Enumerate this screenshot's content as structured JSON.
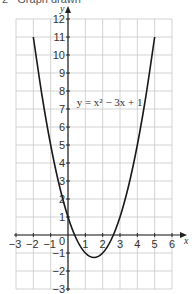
{
  "header": {
    "number": "2",
    "text": "Graph drawn"
  },
  "chart_data": {
    "type": "line",
    "title": "",
    "xlabel": "x",
    "ylabel": "y",
    "xlim": [
      -3,
      6
    ],
    "ylim": [
      -3,
      12
    ],
    "grid": true,
    "legend": null,
    "x_ticks": [
      -3,
      -2,
      -1,
      0,
      1,
      2,
      3,
      4,
      5,
      6
    ],
    "y_ticks": [
      -3,
      -2,
      -1,
      1,
      2,
      3,
      4,
      5,
      6,
      7,
      8,
      9,
      10,
      11,
      12
    ],
    "origin_label": "0",
    "annotations": [
      {
        "text": "y = x² − 3x + 1",
        "x": 0.5,
        "y": 7.4
      }
    ],
    "series": [
      {
        "name": "y = x² − 3x + 1",
        "x": [
          -2,
          -1.5,
          -1,
          -0.5,
          0,
          0.5,
          1,
          1.5,
          2,
          2.5,
          3,
          3.5,
          4,
          4.5,
          5
        ],
        "y": [
          11,
          7.75,
          5,
          2.75,
          1,
          -0.25,
          -1,
          -1.25,
          -1,
          -0.25,
          1,
          2.75,
          5,
          7.75,
          11
        ]
      }
    ]
  },
  "colors": {
    "grid": "#c8c8c8",
    "axis": "#222222",
    "curve": "#1a1a1a"
  }
}
